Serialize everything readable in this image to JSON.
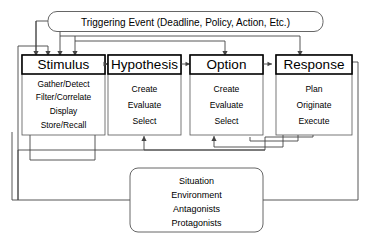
{
  "diagram": {
    "title_box": {
      "label": "Triggering Event (Deadline, Policy, Action, Etc.)",
      "shape": "rounded-rectangle"
    },
    "stages": [
      {
        "header": "Stimulus",
        "items": [
          "Gather/Detect",
          "Filter/Correlate",
          "Display",
          "Store/Recall"
        ]
      },
      {
        "header": "Hypothesis",
        "items": [
          "Create",
          "Evaluate",
          "Select"
        ]
      },
      {
        "header": "Option",
        "items": [
          "Create",
          "Evaluate",
          "Select"
        ]
      },
      {
        "header": "Response",
        "items": [
          "Plan",
          "Originate",
          "Execute"
        ]
      }
    ],
    "context_box": {
      "items": [
        "Situation",
        "Environment",
        "Antagonists",
        "Protagonists"
      ],
      "shape": "rounded-rectangle"
    },
    "colors": {
      "background": "#ffffff",
      "line": "#444444",
      "header_border": "#000000",
      "text": "#000000"
    }
  }
}
